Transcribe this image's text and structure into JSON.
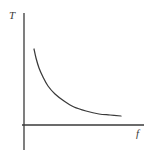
{
  "figure": {
    "background_color": "#ffffff",
    "ink_color": "#3a3a3a",
    "width": 150,
    "height": 157
  },
  "chart_data": {
    "type": "line",
    "title": "",
    "xlabel": "f",
    "ylabel": "T",
    "grid": false,
    "legend": null,
    "axis_style": "bare-axes-no-ticks",
    "x_axis": {
      "label": "f",
      "start_px": 22,
      "end_px": 144,
      "y_px": 125,
      "ticks": [],
      "tick_labels": [],
      "arrow": false
    },
    "y_axis": {
      "label": "T",
      "x_px": 24,
      "top_px": 13,
      "bottom_px": 150,
      "ticks": [],
      "tick_labels": [],
      "arrow": false
    },
    "series": [
      {
        "name": "T vs f",
        "description": "monotonically decreasing convex curve approaching a horizontal asymptote",
        "points": [
          [
            34,
            49
          ],
          [
            36,
            58
          ],
          [
            39,
            68
          ],
          [
            43,
            77
          ],
          [
            48,
            86
          ],
          [
            55,
            94
          ],
          [
            64,
            101
          ],
          [
            74,
            107
          ],
          [
            86,
            111
          ],
          [
            99,
            114
          ],
          [
            110,
            115
          ],
          [
            121,
            116
          ]
        ]
      }
    ],
    "annotations": []
  },
  "labels": {
    "y": "T",
    "x": "f"
  }
}
